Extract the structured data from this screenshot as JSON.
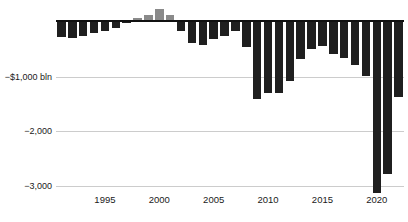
{
  "chart_data": {
    "type": "bar",
    "title": "",
    "x": [
      1991,
      1992,
      1993,
      1994,
      1995,
      1996,
      1997,
      1998,
      1999,
      2000,
      2001,
      2002,
      2003,
      2004,
      2005,
      2006,
      2007,
      2008,
      2009,
      2010,
      2011,
      2012,
      2013,
      2014,
      2015,
      2016,
      2017,
      2018,
      2019,
      2020,
      2021,
      2022
    ],
    "values": [
      -269,
      -290,
      -255,
      -203,
      -164,
      -107,
      -22,
      69,
      126,
      236,
      128,
      -158,
      -378,
      -413,
      -318,
      -248,
      -161,
      -459,
      -1413,
      -1294,
      -1300,
      -1087,
      -680,
      -485,
      -442,
      -585,
      -665,
      -779,
      -984,
      -3132,
      -2772,
      -1375
    ],
    "x_ticks": [
      {
        "year": 1995,
        "label": "1995"
      },
      {
        "year": 2000,
        "label": "2000"
      },
      {
        "year": 2005,
        "label": "2005"
      },
      {
        "year": 2010,
        "label": "2010"
      },
      {
        "year": 2015,
        "label": "2015"
      },
      {
        "year": 2020,
        "label": "2020"
      }
    ],
    "y_ticks": [
      {
        "value": -1000,
        "label": "−$1,000 bln"
      },
      {
        "value": -2000,
        "label": "−2,000"
      },
      {
        "value": -3000,
        "label": "−3,000"
      }
    ],
    "ylim": [
      300,
      -3300
    ],
    "grid": true,
    "legend_position": "none",
    "colors": {
      "deficit_bar": "#1f1f1f",
      "surplus_bar": "#8a8a8a",
      "gridline": "#cccccc",
      "axis_line": "#111111",
      "text": "#1a1a1a"
    }
  }
}
